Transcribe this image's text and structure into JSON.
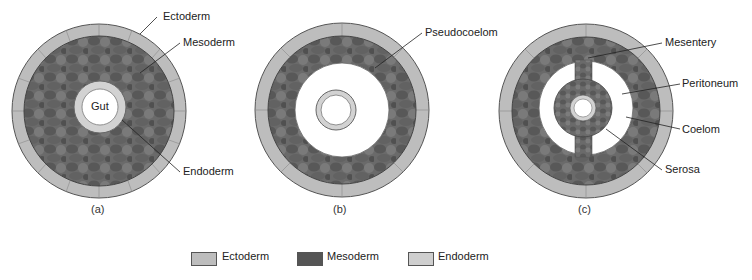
{
  "figure": {
    "panels": [
      {
        "caption": "(a)",
        "labels": {
          "ectoderm": "Ectoderm",
          "mesoderm": "Mesoderm",
          "gut": "Gut",
          "endoderm": "Endoderm"
        }
      },
      {
        "caption": "(b)",
        "labels": {
          "pseudocoelom": "Pseudocoelom"
        }
      },
      {
        "caption": "(c)",
        "labels": {
          "mesentery": "Mesentery",
          "peritoneum": "Peritoneum",
          "coelom": "Coelom",
          "serosa": "Serosa"
        }
      }
    ]
  },
  "legend": {
    "items": [
      {
        "label": "Ectoderm",
        "color": "#bdbdbd"
      },
      {
        "label": "Mesoderm",
        "color": "#5a5a5a"
      },
      {
        "label": "Endoderm",
        "color": "#cfcfcf"
      }
    ]
  },
  "colors": {
    "ectoderm": "#bdbdbd",
    "mesoderm": "#5e5e5e",
    "endoderm": "#d2d2d2",
    "cavity": "#ffffff",
    "outline": "#555555"
  }
}
